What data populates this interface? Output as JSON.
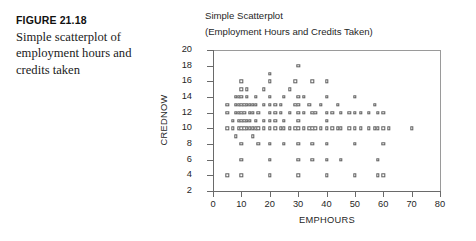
{
  "figure": {
    "number": "FIGURE 21.18",
    "caption": "Simple scatterplot of employment hours and credits taken"
  },
  "chart_data": {
    "type": "scatter",
    "title": "Simple Scatterplot",
    "subtitle": "(Employment Hours and Credits Taken)",
    "xlabel": "EMPHOURS",
    "ylabel": "CREDNOW",
    "xlim": [
      0,
      80
    ],
    "ylim": [
      2,
      20
    ],
    "xticks": [
      0,
      10,
      20,
      30,
      40,
      50,
      60,
      70,
      80
    ],
    "yticks": [
      2,
      4,
      6,
      8,
      10,
      12,
      14,
      16,
      18,
      20
    ],
    "grid": false,
    "legend": null,
    "marker": "open-square",
    "marker_color": "#5d5d5d",
    "points": [
      [
        5,
        4
      ],
      [
        5,
        10
      ],
      [
        5,
        12
      ],
      [
        5,
        13
      ],
      [
        7,
        10
      ],
      [
        7,
        11
      ],
      [
        8,
        14
      ],
      [
        8,
        12
      ],
      [
        8,
        13
      ],
      [
        8,
        9
      ],
      [
        9,
        10
      ],
      [
        9,
        11
      ],
      [
        9,
        12
      ],
      [
        9,
        13
      ],
      [
        9,
        14
      ],
      [
        10,
        16
      ],
      [
        10,
        4
      ],
      [
        10,
        6
      ],
      [
        10,
        8
      ],
      [
        10,
        10
      ],
      [
        10,
        11
      ],
      [
        10,
        12
      ],
      [
        10,
        13
      ],
      [
        10,
        14
      ],
      [
        10,
        15
      ],
      [
        11,
        10
      ],
      [
        11,
        11
      ],
      [
        11,
        12
      ],
      [
        11,
        13
      ],
      [
        12,
        10
      ],
      [
        12,
        11
      ],
      [
        12,
        14
      ],
      [
        12,
        15
      ],
      [
        12,
        13
      ],
      [
        13,
        10
      ],
      [
        13,
        11
      ],
      [
        13,
        12
      ],
      [
        13,
        13
      ],
      [
        14,
        10
      ],
      [
        14,
        12
      ],
      [
        14,
        13
      ],
      [
        14,
        9
      ],
      [
        15,
        10
      ],
      [
        15,
        11
      ],
      [
        15,
        13
      ],
      [
        15,
        14
      ],
      [
        16,
        10
      ],
      [
        16,
        8
      ],
      [
        16,
        12
      ],
      [
        18,
        10
      ],
      [
        18,
        11
      ],
      [
        18,
        13
      ],
      [
        18,
        15
      ],
      [
        20,
        4
      ],
      [
        20,
        6
      ],
      [
        20,
        8
      ],
      [
        20,
        10
      ],
      [
        20,
        11
      ],
      [
        20,
        12
      ],
      [
        20,
        13
      ],
      [
        20,
        14
      ],
      [
        20,
        16
      ],
      [
        20,
        17
      ],
      [
        22,
        10
      ],
      [
        22,
        11
      ],
      [
        22,
        12
      ],
      [
        22,
        13
      ],
      [
        24,
        10
      ],
      [
        24,
        12
      ],
      [
        24,
        13
      ],
      [
        25,
        8
      ],
      [
        25,
        10
      ],
      [
        25,
        11
      ],
      [
        25,
        14
      ],
      [
        27,
        10
      ],
      [
        27,
        12
      ],
      [
        27,
        15
      ],
      [
        29,
        10
      ],
      [
        29,
        13
      ],
      [
        29,
        16
      ],
      [
        30,
        4
      ],
      [
        30,
        6
      ],
      [
        30,
        8
      ],
      [
        30,
        10
      ],
      [
        30,
        11
      ],
      [
        30,
        12
      ],
      [
        30,
        13
      ],
      [
        30,
        14
      ],
      [
        30,
        18
      ],
      [
        32,
        10
      ],
      [
        32,
        12
      ],
      [
        32,
        14
      ],
      [
        34,
        10
      ],
      [
        34,
        13
      ],
      [
        35,
        6
      ],
      [
        35,
        8
      ],
      [
        35,
        10
      ],
      [
        35,
        12
      ],
      [
        35,
        16
      ],
      [
        36,
        10
      ],
      [
        36,
        12
      ],
      [
        38,
        10
      ],
      [
        38,
        13
      ],
      [
        40,
        4
      ],
      [
        40,
        6
      ],
      [
        40,
        8
      ],
      [
        40,
        10
      ],
      [
        40,
        11
      ],
      [
        40,
        12
      ],
      [
        40,
        14
      ],
      [
        40,
        16
      ],
      [
        42,
        10
      ],
      [
        42,
        12
      ],
      [
        44,
        10
      ],
      [
        44,
        13
      ],
      [
        45,
        6
      ],
      [
        45,
        10
      ],
      [
        45,
        12
      ],
      [
        48,
        10
      ],
      [
        48,
        12
      ],
      [
        50,
        4
      ],
      [
        50,
        8
      ],
      [
        50,
        10
      ],
      [
        50,
        12
      ],
      [
        50,
        14
      ],
      [
        52,
        10
      ],
      [
        52,
        12
      ],
      [
        55,
        10
      ],
      [
        55,
        12
      ],
      [
        57,
        10
      ],
      [
        57,
        13
      ],
      [
        58,
        4
      ],
      [
        58,
        6
      ],
      [
        58,
        10
      ],
      [
        58,
        12
      ],
      [
        60,
        4
      ],
      [
        60,
        8
      ],
      [
        60,
        10
      ],
      [
        60,
        12
      ],
      [
        62,
        10
      ],
      [
        70,
        10
      ]
    ]
  }
}
